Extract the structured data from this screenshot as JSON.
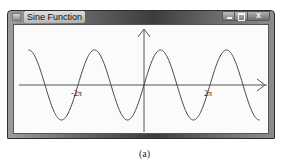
{
  "window": {
    "title": "Sine Function",
    "controls": {
      "minimize": "minimize",
      "maximize": "maximize",
      "close": "x"
    }
  },
  "plot": {
    "function": "sin(x)",
    "x_labels": [
      {
        "text": "-2π",
        "value": -6.2832
      },
      {
        "text": "2π",
        "value": 6.2832
      }
    ],
    "x_range": [
      -11.0,
      11.0
    ],
    "axes": {
      "x_axis": true,
      "y_axis": true,
      "arrows": true
    }
  },
  "caption": "(a)"
}
